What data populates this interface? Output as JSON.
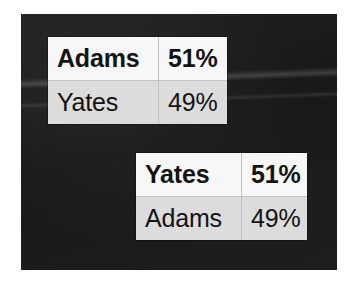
{
  "slide": {
    "background_color": "#1c1c1c",
    "outer_background_color": "#ffffff"
  },
  "tables": [
    {
      "name": "adams-leads",
      "rows": [
        {
          "candidate": "Adams",
          "percent": "51%",
          "emphasis": "leader"
        },
        {
          "candidate": "Yates",
          "percent": "49%",
          "emphasis": "trailer"
        }
      ]
    },
    {
      "name": "yates-leads",
      "rows": [
        {
          "candidate": "Yates",
          "percent": "51%",
          "emphasis": "leader"
        },
        {
          "candidate": "Adams",
          "percent": "49%",
          "emphasis": "trailer"
        }
      ]
    }
  ]
}
